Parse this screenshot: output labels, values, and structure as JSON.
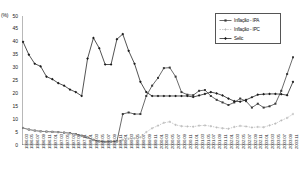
{
  "chart_data": {
    "type": "line",
    "title": "",
    "xlabel": "",
    "ylabel": "(%)",
    "ylim": [
      0,
      50
    ],
    "yticks": [
      0,
      5,
      10,
      15,
      20,
      25,
      30,
      35,
      40,
      45,
      50
    ],
    "grid": false,
    "legend_position": "top-right",
    "x": [
      "1996.03",
      "1996.05",
      "1996.07",
      "1996.09",
      "1996.11",
      "1997.01",
      "1997.03",
      "1997.05",
      "1997.07",
      "1997.09",
      "1997.11",
      "1998.01",
      "1998.03",
      "1998.05",
      "1998.07",
      "1998.09",
      "1998.11",
      "1999.01",
      "1999.03",
      "1999.05",
      "1999.07",
      "1999.09",
      "1999.11",
      "2000.01",
      "2000.03",
      "2000.05",
      "2000.07",
      "2000.09",
      "2000.11",
      "2001.01",
      "2001.03",
      "2001.05",
      "2001.07",
      "2001.09",
      "2001.11",
      "2002.01",
      "2002.03",
      "2002.05",
      "2002.07",
      "2002.09",
      "2002.11",
      "2003.01",
      "2003.03",
      "2003.05",
      "2003.07",
      "2003.09",
      "2003.11"
    ],
    "series": [
      {
        "name": "Inflação - IPA",
        "values": [
          6.6,
          6.0,
          5.6,
          5.3,
          5.2,
          5.1,
          5.0,
          4.8,
          4.6,
          4.2,
          3.6,
          2.9,
          2.0,
          1.4,
          1.2,
          1.3,
          1.4,
          12.0,
          12.6,
          12.0,
          12.0,
          19.0,
          23.0,
          26.0,
          29.8,
          30.0,
          26.5,
          20.5,
          19.5,
          19.3,
          21.0,
          21.3,
          19.0,
          17.5,
          16.5,
          15.5,
          16.5,
          18.0,
          17.0,
          14.5,
          16.0,
          14.5,
          15.0,
          16.0,
          21.0,
          27.5,
          34.0
        ]
      },
      {
        "name": "Inflação - IPC",
        "values": [
          6.6,
          6.0,
          5.6,
          5.3,
          5.2,
          5.1,
          5.0,
          4.8,
          4.5,
          4.1,
          3.5,
          2.8,
          1.9,
          1.3,
          1.1,
          1.2,
          1.3,
          2.0,
          2.4,
          2.6,
          3.0,
          5.0,
          6.5,
          7.5,
          8.6,
          9.0,
          7.8,
          7.3,
          7.2,
          7.1,
          7.5,
          7.6,
          7.3,
          6.8,
          6.5,
          6.3,
          7.0,
          7.4,
          7.2,
          6.8,
          7.0,
          6.9,
          7.6,
          8.3,
          9.5,
          10.5,
          12.0
        ]
      },
      {
        "name": "Selic",
        "values": [
          40.0,
          35.0,
          31.5,
          30.5,
          26.5,
          25.5,
          24.0,
          23.0,
          21.5,
          20.5,
          19.0,
          33.5,
          41.5,
          37.5,
          31.2,
          31.2,
          41.0,
          43.0,
          36.5,
          31.5,
          24.5,
          20.5,
          19.0,
          19.0,
          19.0,
          19.0,
          19.0,
          19.0,
          19.0,
          18.6,
          19.2,
          19.8,
          20.5,
          20.0,
          19.2,
          18.0,
          17.0,
          16.8,
          17.5,
          18.5,
          19.5,
          19.7,
          19.8,
          19.8,
          19.7,
          19.3,
          24.5
        ]
      }
    ]
  },
  "legend": {
    "items": [
      {
        "label": "Inflação - IPA",
        "color": "#3a3a3a",
        "style": "solid",
        "marker": "square"
      },
      {
        "label": "Inflação - IPC",
        "color": "#b4b4b4",
        "style": "dotted",
        "marker": "plus"
      },
      {
        "label": "Selic",
        "color": "#1a1a1a",
        "style": "solid",
        "marker": "diamond"
      }
    ]
  }
}
